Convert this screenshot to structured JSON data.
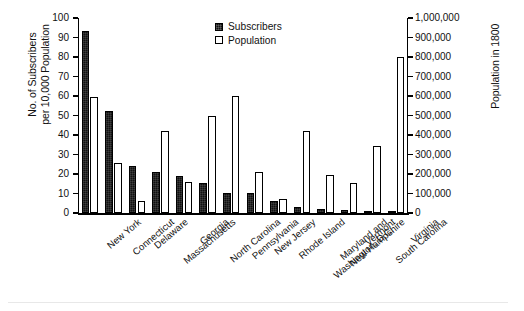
{
  "chart_data": {
    "type": "bar",
    "title": "",
    "subtitle": "",
    "xlabel": "",
    "ylabel": "No. of Subscribers\nper 10,000 Population",
    "y2label": "Population in 1800",
    "grid": false,
    "legend_position": "top-center",
    "ylim": [
      0,
      100
    ],
    "y2lim": [
      0,
      1000000
    ],
    "yticks": [
      0,
      10,
      20,
      30,
      40,
      50,
      60,
      70,
      80,
      90,
      100
    ],
    "ytick_labels": [
      "0",
      "10",
      "20",
      "30",
      "40",
      "50",
      "60",
      "70",
      "80",
      "90",
      "100"
    ],
    "y2ticks": [
      0,
      100000,
      200000,
      300000,
      400000,
      500000,
      600000,
      700000,
      800000,
      900000,
      1000000
    ],
    "y2tick_labels": [
      "0",
      "100,000",
      "200,000",
      "300,000",
      "400,000",
      "500,000",
      "600,000",
      "700,000",
      "800,000",
      "900,000",
      "1,000,000"
    ],
    "categories": [
      "New York",
      "Connecticut",
      "Delaware",
      "Massachusetts",
      "Georgia",
      "North Carolina",
      "Pennsylvania",
      "New Jersey",
      "Rhode Island",
      "Maryland and\nWashington, D.C.",
      "New Hampshire",
      "Vermont",
      "South Carolina",
      "Virginia"
    ],
    "series": [
      {
        "name": "Subscribers",
        "axis": "left",
        "unit": "subscribers per 10,000 population",
        "color": "#111111",
        "fill": "solid-black",
        "values": [
          93.5,
          52.5,
          24.2,
          21.0,
          19.0,
          15.2,
          10.3,
          10.3,
          6.0,
          3.2,
          2.0,
          1.6,
          1.1,
          0.8
        ]
      },
      {
        "name": "Population",
        "axis": "right",
        "unit": "persons in 1800",
        "color": "#ffffff",
        "fill": "white-outline",
        "values": [
          595000,
          255000,
          62000,
          422000,
          160000,
          495000,
          600000,
          211000,
          70000,
          420000,
          193000,
          155000,
          345000,
          800000
        ],
        "values_on_left_scale": [
          59.5,
          25.5,
          6.2,
          42.2,
          16.0,
          49.5,
          60.0,
          21.1,
          7.0,
          42.0,
          19.3,
          15.5,
          34.5,
          80.0
        ]
      }
    ]
  },
  "legend": {
    "items": [
      {
        "label": "Subscribers",
        "style": "filled"
      },
      {
        "label": "Population",
        "style": "outline"
      }
    ]
  }
}
